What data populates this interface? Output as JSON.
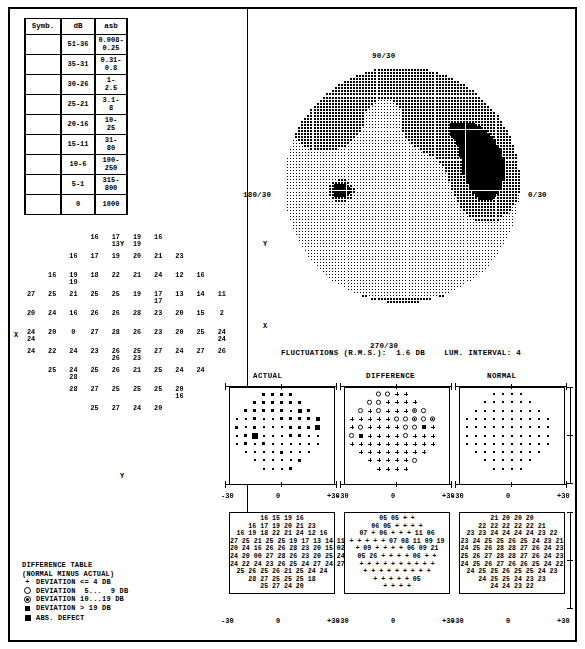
{
  "symbol_table": {
    "headers": [
      "Symb.",
      "dB",
      "asb"
    ],
    "rows": [
      {
        "db": "51-36",
        "asb": [
          "0.008-",
          "0.25"
        ],
        "density": 1
      },
      {
        "db": "35-31",
        "asb": [
          "0.31-",
          "0.8"
        ],
        "density": 2
      },
      {
        "db": "30-26",
        "asb": [
          "1-",
          "2.5"
        ],
        "density": 3
      },
      {
        "db": "25-21",
        "asb": [
          "3.1-",
          "8"
        ],
        "density": 4
      },
      {
        "db": "20-16",
        "asb": [
          "10-",
          "25"
        ],
        "density": 5
      },
      {
        "db": "15-11",
        "asb": [
          "31-",
          "80"
        ],
        "density": 6
      },
      {
        "db": "10-6",
        "asb": [
          "100-",
          "250"
        ],
        "density": 7
      },
      {
        "db": "5-1",
        "asb": [
          "315-",
          "800"
        ],
        "density": 8
      },
      {
        "db": "0",
        "asb": [
          "1000",
          ""
        ],
        "density": 9
      }
    ]
  },
  "gray_plot": {
    "label_top": "90/30",
    "label_bottom": "270/30",
    "label_right": "0/30",
    "label_left": "180/30",
    "axis_x_marker": "X",
    "axis_y_marker": "Y"
  },
  "status_line": "FLUCTUATIONS (R.M.S.):  1.6 DB    LUM. INTERVAL: 4",
  "numeric_field": {
    "axis_x_marker": "X",
    "axis_y_marker": "Y",
    "rows": [
      {
        "indent": 3,
        "values": [
          "16",
          "17\n13",
          "19\n19",
          "16"
        ]
      },
      {
        "indent": 2,
        "values": [
          "16",
          "17",
          "19",
          "20",
          "21",
          "23"
        ]
      },
      {
        "indent": 1,
        "values": [
          "16",
          "19\n19",
          "18",
          "22",
          "21",
          "24",
          "12",
          "16"
        ]
      },
      {
        "indent": 0,
        "values": [
          "27",
          "25",
          "21",
          "25",
          "25",
          "19",
          "17\n17",
          "13",
          "14",
          "11"
        ]
      },
      {
        "indent": 0,
        "values": [
          "20",
          "24",
          "16",
          "26",
          "26",
          "28",
          "23",
          "20",
          "15",
          "2"
        ]
      },
      {
        "indent": 0,
        "values": [
          "24\n24",
          "20",
          "0",
          "27",
          "28",
          "26",
          "23",
          "20",
          "25",
          "24\n24"
        ]
      },
      {
        "indent": 0,
        "values": [
          "24",
          "22",
          "24",
          "23",
          "26\n26",
          "25\n23",
          "27",
          "24",
          "27",
          "26"
        ]
      },
      {
        "indent": 1,
        "values": [
          "25",
          "24\n28",
          "25",
          "26",
          "21",
          "25",
          "24",
          "24"
        ]
      },
      {
        "indent": 2,
        "values": [
          "28",
          "27",
          "25",
          "25",
          "25",
          "20\n16"
        ]
      },
      {
        "indent": 3,
        "values": [
          "25",
          "27",
          "24",
          "20"
        ]
      }
    ]
  },
  "panels": {
    "headers": [
      "ACTUAL",
      "DIFFERENCE",
      "NORMAL"
    ],
    "axis_labels_y": [
      "+30",
      "0",
      "-30"
    ],
    "axis_labels_x": [
      "-30",
      "0",
      "+30"
    ]
  },
  "numeric_tables": {
    "actual": [
      "16 15 19 16",
      "16 17 19 20 21 23",
      "16 19 18 22 21 24 12 16",
      "27 25 21 25 25 19 17 13 14 11",
      "20 24 16 26 26 28 23 20 15 02",
      "24 20 00 27 28 26 23 20 25 24",
      "24 22 24 23 26 25 24 27 24 27 26",
      "25 26 25 26 21 25 24 24",
      "28 27 25 25 25 18",
      "25 27 24 20"
    ],
    "difference": [
      "05 05 + +",
      "06 05 + + + +",
      "07 + 06 + + + 11 06",
      "+ + + + + 07 08 11 09 19",
      "+ 09 + + + + 06 09 21",
      "05 26 + + + + 06 + +",
      "+ + + + + + + + + +",
      "+ + + + + + + + +",
      "+ + + + + 05",
      "+ + + +"
    ],
    "normal": [
      "21 20 20 20",
      "22 22 22 22 22 21",
      "23 23 24 24 24 24 23 22",
      "23 24 25 25 26 25 24 23 21",
      "24 25 26 28 28 27 26 24 23",
      "25 26 27 28 28 27 26 24 23",
      "24 25 26 27 26 26 25 24 22",
      "24 25 25 26 25 25 24 23",
      "24 25 25 24 23 23",
      "24 24 23 22"
    ]
  },
  "difference_legend": {
    "title": "DIFFERENCE TABLE",
    "subtitle": "(NORMAL MINUS ACTUAL)",
    "entries": [
      {
        "symbol": "plus",
        "text": "DEVIATION <= 4 DB"
      },
      {
        "symbol": "circle",
        "text": "DEVIATION  5...  9 DB"
      },
      {
        "symbol": "circle-dot",
        "text": "DEVIATION 10...19 DB"
      },
      {
        "symbol": "filled-small",
        "text": "DEVIATION > 19 DB"
      },
      {
        "symbol": "filled-big",
        "text": "ABS. DEFECT"
      }
    ]
  }
}
